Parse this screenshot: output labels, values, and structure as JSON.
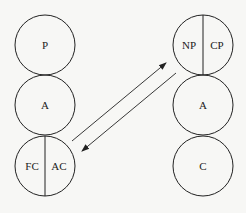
{
  "diagram": {
    "left_column": {
      "circles": [
        {
          "labels": [
            "P"
          ]
        },
        {
          "labels": [
            "A"
          ]
        },
        {
          "labels": [
            "FC",
            "AC"
          ]
        }
      ]
    },
    "right_column": {
      "circles": [
        {
          "labels": [
            "NP",
            "CP"
          ]
        },
        {
          "labels": [
            "A"
          ]
        },
        {
          "labels": [
            "C"
          ]
        }
      ]
    },
    "arrows": [
      {
        "from": "left_column.circles.2",
        "to": "right_column.circles.0",
        "direction": "up-right"
      },
      {
        "from": "right_column.circles.0",
        "to": "left_column.circles.2",
        "direction": "down-left"
      }
    ],
    "colors": {
      "stroke": "#222222",
      "background": "#f7f7f5"
    }
  }
}
